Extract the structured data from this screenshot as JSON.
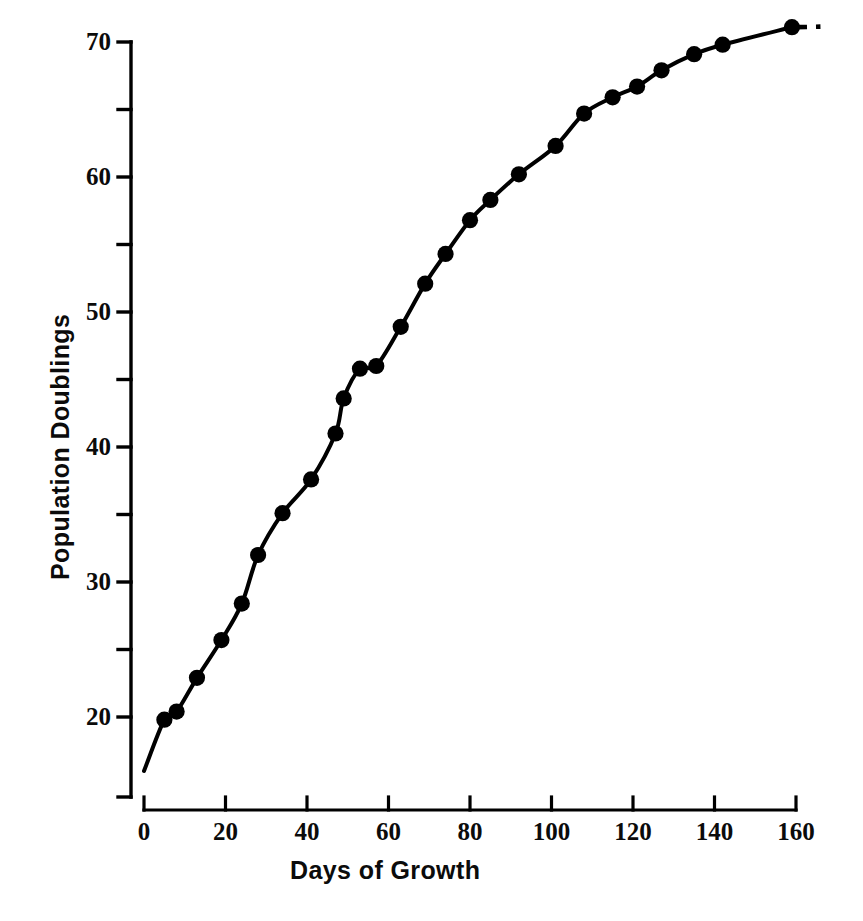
{
  "chart_data": {
    "type": "line",
    "title": "",
    "xlabel": "Days of Growth",
    "ylabel": "Population Doublings",
    "xlim": [
      0,
      163
    ],
    "ylim": [
      15.5,
      71.5
    ],
    "grid": false,
    "legend": null,
    "marker": "filled-circle",
    "line_style": "solid-with-dashed-extension",
    "xticks": [
      0,
      20,
      40,
      60,
      80,
      100,
      120,
      140,
      160
    ],
    "xtick_labels": [
      "0",
      "20",
      "40",
      "60",
      "80",
      "100",
      "120",
      "140",
      "160"
    ],
    "yticks": [
      20,
      30,
      40,
      50,
      60,
      70
    ],
    "ytick_labels": [
      "20",
      "30",
      "40",
      "50",
      "60",
      "70"
    ],
    "yminor_ticks": [
      25,
      35,
      45,
      55,
      65
    ],
    "series": [
      {
        "name": "Population Doublings",
        "color": "#000000",
        "x": [
          5,
          8,
          13,
          19,
          24,
          28,
          34,
          41,
          47,
          49,
          53,
          57,
          63,
          69,
          74,
          80,
          85,
          92,
          101,
          108,
          115,
          121,
          127,
          135,
          142,
          159
        ],
        "y": [
          19.8,
          20.4,
          22.9,
          25.7,
          28.4,
          32.0,
          35.1,
          37.6,
          41.0,
          43.6,
          45.8,
          46.0,
          48.9,
          52.1,
          54.3,
          56.8,
          58.3,
          60.2,
          62.3,
          64.7,
          65.9,
          66.7,
          67.9,
          69.1,
          69.8,
          71.1
        ]
      }
    ],
    "curve_description": "Saturating growth curve: near-linear rise from about 16 doublings at day 0 to about 55 doublings at day 75, then progressively flattening to a plateau near 71 doublings at day 160.",
    "dashed_extension": {
      "from_x": 160,
      "to_x": 166,
      "y": 71.1
    }
  },
  "axes": {
    "y_axis_name": "population-doublings-axis",
    "x_axis_name": "days-of-growth-axis"
  }
}
